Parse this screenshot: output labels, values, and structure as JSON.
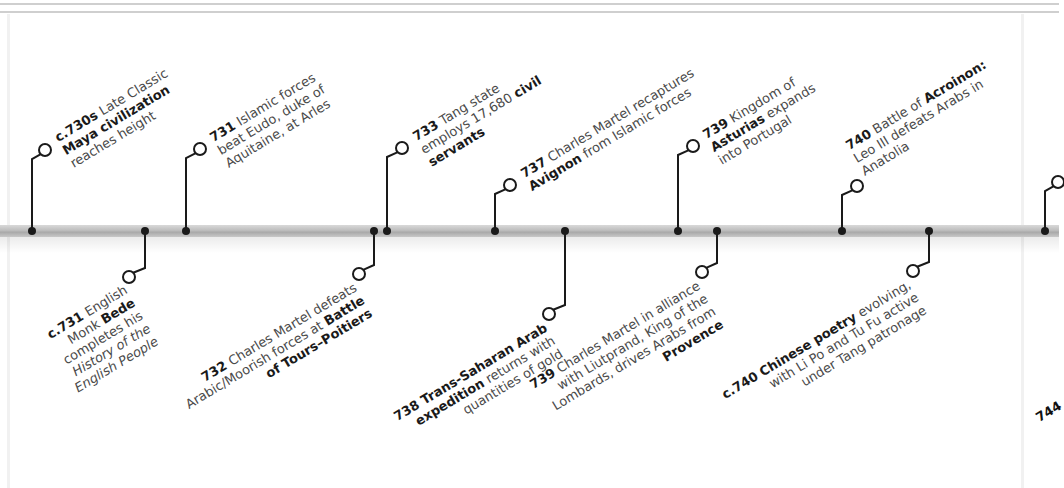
{
  "timeline": {
    "bar_color": "#bdbdbd",
    "connector_color": "#1a1a1a",
    "events_above": [
      {
        "id": "c730s",
        "dot_x": 32,
        "circle": [
          45,
          150
        ],
        "label_pos": [
          52,
          132
        ],
        "lines": [
          [
            {
              "t": "c.730s",
              "b": true
            },
            {
              "t": " Late Classic",
              "b": false
            }
          ],
          [
            {
              "t": "Maya civilization",
              "b": true
            }
          ],
          [
            {
              "t": "reaches height",
              "b": false
            }
          ]
        ]
      },
      {
        "id": "731",
        "dot_x": 186,
        "circle": [
          200,
          149
        ],
        "label_pos": [
          207,
          132
        ],
        "lines": [
          [
            {
              "t": "731",
              "b": true
            },
            {
              "t": " Islamic forces",
              "b": false
            }
          ],
          [
            {
              "t": "beat Eudo, duke of",
              "b": false
            }
          ],
          [
            {
              "t": "Aquitaine, at Arles",
              "b": false
            }
          ]
        ]
      },
      {
        "id": "733",
        "dot_x": 387,
        "circle": [
          402,
          148
        ],
        "label_pos": [
          410,
          131
        ],
        "lines": [
          [
            {
              "t": "733",
              "b": true
            },
            {
              "t": " Tang state",
              "b": false
            }
          ],
          [
            {
              "t": "employs 17,680 ",
              "b": false
            },
            {
              "t": "civil",
              "b": true
            }
          ],
          [
            {
              "t": "servants",
              "b": true
            }
          ]
        ]
      },
      {
        "id": "737",
        "dot_x": 495,
        "circle": [
          510,
          185
        ],
        "label_pos": [
          518,
          168
        ],
        "lines": [
          [
            {
              "t": "737",
              "b": true
            },
            {
              "t": " Charles Martel recaptures",
              "b": false
            }
          ],
          [
            {
              "t": "Avignon",
              "b": true
            },
            {
              "t": " from Islamic forces",
              "b": false
            }
          ]
        ]
      },
      {
        "id": "739a",
        "dot_x": 678,
        "circle": [
          693,
          146
        ],
        "label_pos": [
          700,
          129
        ],
        "lines": [
          [
            {
              "t": "739",
              "b": true
            },
            {
              "t": " Kingdom of",
              "b": false
            }
          ],
          [
            {
              "t": "Asturias",
              "b": true
            },
            {
              "t": " expands",
              "b": false
            }
          ],
          [
            {
              "t": "into Portugal",
              "b": false
            }
          ]
        ]
      },
      {
        "id": "740",
        "dot_x": 842,
        "circle": [
          857,
          186
        ],
        "label_pos": [
          843,
          140
        ],
        "lines": [
          [
            {
              "t": "740",
              "b": true
            },
            {
              "t": " Battle of ",
              "b": false
            },
            {
              "t": "Acroinon:",
              "b": true
            }
          ],
          [
            {
              "t": "Leo III defeats Arabs in",
              "b": false
            }
          ],
          [
            {
              "t": "Anatolia",
              "b": false
            }
          ]
        ]
      },
      {
        "id": "partial-right",
        "dot_x": 1045,
        "circle": [
          1058,
          182
        ],
        "label_pos": [
          1062,
          160
        ],
        "lines": [
          [
            {
              "t": "",
              "b": true
            }
          ]
        ]
      }
    ],
    "events_below": [
      {
        "id": "c731",
        "dot_x": 145,
        "circle": [
          129,
          277
        ],
        "label_anchor": [
          122,
          282
        ],
        "lines": [
          [
            {
              "t": "c.731",
              "b": true
            },
            {
              "t": " English",
              "b": false
            }
          ],
          [
            {
              "t": "Monk ",
              "b": false
            },
            {
              "t": "Bede",
              "b": true
            }
          ],
          [
            {
              "t": "completes his",
              "b": false
            }
          ],
          [
            {
              "t": "History of the",
              "b": false,
              "i": true
            }
          ],
          [
            {
              "t": "English People",
              "b": false,
              "i": true
            }
          ]
        ]
      },
      {
        "id": "732",
        "dot_x": 374,
        "circle": [
          359,
          274
        ],
        "label_anchor": [
          352,
          280
        ],
        "lines": [
          [
            {
              "t": "732",
              "b": true
            },
            {
              "t": " Charles Martel defeats",
              "b": false
            }
          ],
          [
            {
              "t": "Arabic/Moorish forces at ",
              "b": false
            },
            {
              "t": "Battle",
              "b": true
            }
          ],
          [
            {
              "t": "of Tours–Poitiers",
              "b": true
            }
          ]
        ]
      },
      {
        "id": "738",
        "dot_x": 565,
        "circle": [
          549,
          314
        ],
        "label_anchor": [
          542,
          320
        ],
        "lines": [
          [
            {
              "t": "738 Trans-Saharan Arab",
              "b": true
            }
          ],
          [
            {
              "t": "expedition",
              "b": true
            },
            {
              "t": " returns with",
              "b": false
            }
          ],
          [
            {
              "t": "quantities of gold",
              "b": false
            }
          ]
        ]
      },
      {
        "id": "739b",
        "dot_x": 717,
        "circle": [
          702,
          272
        ],
        "label_anchor": [
          695,
          278
        ],
        "lines": [
          [
            {
              "t": "739",
              "b": true
            },
            {
              "t": " Charles Martel in alliance",
              "b": false
            }
          ],
          [
            {
              "t": "with Liutprand, King of the",
              "b": false
            }
          ],
          [
            {
              "t": "Lombards, drives Arabs from",
              "b": false
            }
          ],
          [
            {
              "t": "Provence",
              "b": true
            }
          ]
        ]
      },
      {
        "id": "c740",
        "dot_x": 929,
        "circle": [
          913,
          271
        ],
        "label_anchor": [
          906,
          277
        ],
        "lines": [
          [
            {
              "t": "c.740",
              "b": true
            },
            {
              "t": " ",
              "b": false
            },
            {
              "t": "Chinese poetry",
              "b": true
            },
            {
              "t": " evolving,",
              "b": false
            }
          ],
          [
            {
              "t": "with Li Po and Tu Fu active",
              "b": false
            }
          ],
          [
            {
              "t": "under Tang patronage",
              "b": false
            }
          ]
        ]
      }
    ],
    "cutoff_label": {
      "text": "744",
      "pos": [
        1033,
        412
      ]
    }
  }
}
